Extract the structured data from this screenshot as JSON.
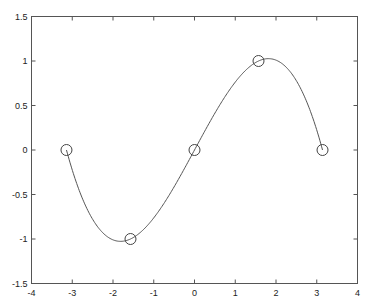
{
  "chart_data": {
    "type": "line",
    "title": "",
    "xlabel": "",
    "ylabel": "",
    "xlim": [
      -4,
      4
    ],
    "ylim": [
      -1.5,
      1.5
    ],
    "grid": false,
    "legend": null,
    "x_ticks": [
      -4,
      -3,
      -2,
      -1,
      0,
      1,
      2,
      3,
      4
    ],
    "x_tick_labels": [
      "-4",
      "-3",
      "-2",
      "-1",
      "0",
      "1",
      "2",
      "3",
      "4"
    ],
    "y_ticks": [
      -1.5,
      -1,
      -0.5,
      0,
      0.5,
      1,
      1.5
    ],
    "y_tick_labels": [
      "-1.5",
      "-1",
      "-0.5",
      "0",
      "0.5",
      "1",
      "1.5"
    ],
    "series": [
      {
        "name": "data points",
        "style": "circle-markers",
        "x": [
          -3.1416,
          -1.5708,
          0,
          1.5708,
          3.1416
        ],
        "y": [
          0,
          -1,
          0,
          1,
          0
        ]
      },
      {
        "name": "cubic spline interpolant",
        "style": "solid-line",
        "interpolation": "not-a-knot cubic spline through data points",
        "x_range": [
          -3.1416,
          3.1416
        ],
        "extrema": [
          {
            "x": -1.8,
            "y": -1.04
          },
          {
            "x": 1.8,
            "y": 1.04
          }
        ]
      }
    ],
    "colors": {
      "line": "#555555",
      "marker": "#444444",
      "axes": "#555555",
      "background": "#ffffff"
    }
  }
}
